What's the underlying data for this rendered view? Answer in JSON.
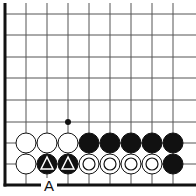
{
  "diagram": {
    "type": "go-board-corner",
    "colors": {
      "background": "#ffffff",
      "line": "#555555",
      "edge": "#111111",
      "black": "#111111",
      "white": "#ffffff"
    },
    "grid": {
      "columns_x": [
        5,
        26,
        47,
        68,
        89,
        110,
        131,
        152,
        173
      ],
      "rows_y": [
        14,
        35,
        57,
        78,
        100,
        122,
        143,
        164,
        185
      ],
      "right_extent": 196,
      "top_extent": 3,
      "left_edge_thick": true,
      "bottom_edge_thick": true
    },
    "stones": [
      {
        "col": 1,
        "row": 6,
        "color": "white",
        "mark": ""
      },
      {
        "col": 2,
        "row": 6,
        "color": "white",
        "mark": ""
      },
      {
        "col": 3,
        "row": 6,
        "color": "white",
        "mark": ""
      },
      {
        "col": 4,
        "row": 6,
        "color": "black",
        "mark": ""
      },
      {
        "col": 5,
        "row": 6,
        "color": "black",
        "mark": ""
      },
      {
        "col": 6,
        "row": 6,
        "color": "black",
        "mark": ""
      },
      {
        "col": 7,
        "row": 6,
        "color": "black",
        "mark": ""
      },
      {
        "col": 8,
        "row": 6,
        "color": "black",
        "mark": ""
      },
      {
        "col": 1,
        "row": 7,
        "color": "white",
        "mark": ""
      },
      {
        "col": 2,
        "row": 7,
        "color": "black",
        "mark": "triangle"
      },
      {
        "col": 3,
        "row": 7,
        "color": "black",
        "mark": "triangle"
      },
      {
        "col": 4,
        "row": 7,
        "color": "white",
        "mark": "circle"
      },
      {
        "col": 5,
        "row": 7,
        "color": "white",
        "mark": "circle"
      },
      {
        "col": 6,
        "row": 7,
        "color": "white",
        "mark": "circle"
      },
      {
        "col": 7,
        "row": 7,
        "color": "white",
        "mark": "circle"
      },
      {
        "col": 8,
        "row": 7,
        "color": "black",
        "mark": ""
      }
    ],
    "point_markers": [
      {
        "col": 3,
        "row": 5,
        "type": "dot"
      }
    ],
    "labels": [
      {
        "text": "A",
        "x": 41,
        "y": 178
      }
    ]
  }
}
